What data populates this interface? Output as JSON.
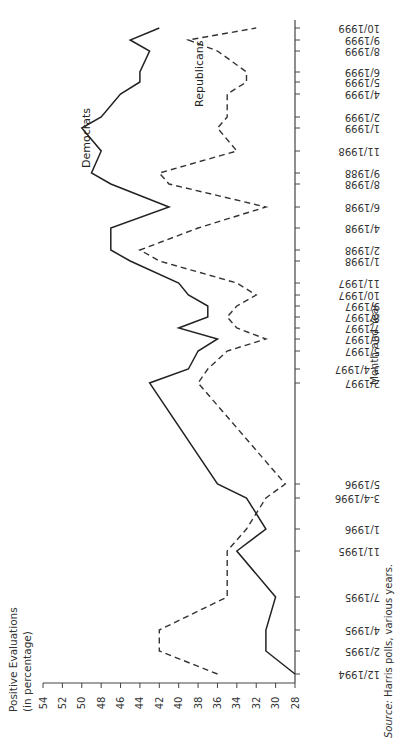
{
  "chart_data": {
    "type": "line",
    "orientation": "rotated-90",
    "title": "",
    "ylabel": "Positive Evaluations (in percentage)",
    "xlabel": "Month and Year",
    "ylim": [
      28,
      54
    ],
    "y_ticks": [
      54,
      52,
      50,
      48,
      46,
      44,
      42,
      40,
      38,
      36,
      34,
      32,
      30,
      28
    ],
    "grid": false,
    "categories": [
      "12/1994",
      "2/1995",
      "4/1995",
      "7/1995",
      "11/1995",
      "1/1996",
      "3-4/1996",
      "5/1996",
      "2/1997",
      "3-4/1997",
      "5/1997",
      "6/1997",
      "7/1997",
      "8/1997",
      "9/1997",
      "10/1997",
      "11/1997",
      "1/1998",
      "2/1998",
      "4/1998",
      "6/1998",
      "8/1998",
      "9/1988",
      "11/1998",
      "1/1999",
      "2/1999",
      "4/1999",
      "5/1999",
      "6/1999",
      "8/1999",
      "9/1999",
      "10/1999"
    ],
    "category_positions": [
      674,
      651,
      630,
      597,
      551,
      529,
      498,
      484,
      383,
      369,
      351,
      339,
      328,
      317,
      306,
      295,
      283,
      261,
      250,
      228,
      207,
      184,
      173,
      151,
      128,
      117,
      94,
      82,
      72,
      51,
      40,
      28
    ],
    "series": [
      {
        "name": "Democrats",
        "style": "solid",
        "values": [
          28,
          31,
          31,
          30,
          34,
          31,
          33,
          36,
          43,
          39,
          38,
          36,
          40,
          37,
          37,
          39,
          40,
          45,
          47,
          47,
          41,
          47,
          49,
          48,
          50,
          48,
          46,
          44,
          44,
          43,
          45,
          42
        ]
      },
      {
        "name": "Republicans",
        "style": "dashed",
        "values": [
          36,
          42,
          42,
          35,
          35,
          33,
          31,
          29,
          38,
          37,
          35,
          31,
          34,
          35,
          34,
          32,
          34,
          42,
          44,
          38,
          31,
          41,
          42,
          34,
          36,
          35,
          35,
          33,
          33,
          36,
          39,
          32
        ]
      }
    ],
    "legend": "inline labels",
    "annotations": [
      "Democrats",
      "Republicans"
    ]
  },
  "labels": {
    "ylabel_line1": "Positive Evaluations",
    "ylabel_line2": "(in percentage)",
    "xlabel": "Month and Year",
    "democrats": "Democrats",
    "republicans": "Republicans",
    "source_prefix": "Source:",
    "source_text": " Harris polls, various years."
  }
}
